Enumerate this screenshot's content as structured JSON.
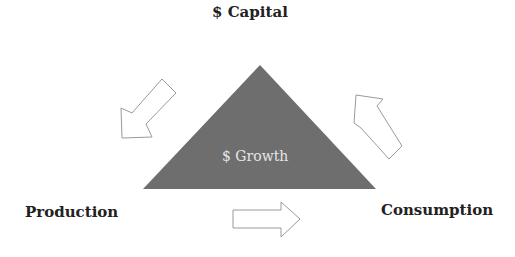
{
  "diagram": {
    "top_label": "$ Capital",
    "left_label": "Production",
    "right_label": "Consumption",
    "center_label": "$ Growth",
    "triangle_color": "#6e6e6e",
    "arrow_stroke": "#9a9a9a",
    "arrows": [
      {
        "name": "capital-to-production",
        "direction": "down-left"
      },
      {
        "name": "production-to-consumption",
        "direction": "right"
      },
      {
        "name": "consumption-to-capital",
        "direction": "up-left"
      }
    ]
  }
}
